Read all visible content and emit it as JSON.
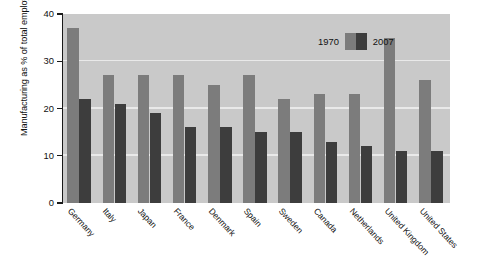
{
  "chart_data": {
    "type": "bar",
    "title": "",
    "xlabel": "",
    "ylabel": "Manufacturing as % of total employment",
    "ylim": [
      0,
      40
    ],
    "yticks": [
      0,
      10,
      20,
      30,
      40
    ],
    "ytick_labels": [
      "0",
      "10",
      "20",
      "30",
      "40"
    ],
    "grid": "horizontal",
    "legend_position": "top-right-inside",
    "categories": [
      "Germany",
      "Italy",
      "Japan",
      "France",
      "Denmark",
      "Spain",
      "Sweden",
      "Canada",
      "Netherlands",
      "United Kingdom",
      "United States"
    ],
    "series": [
      {
        "name": "1970",
        "color": "#7c7c7c",
        "values": [
          37,
          27,
          27,
          27,
          25,
          27,
          22,
          23,
          23,
          35,
          26
        ]
      },
      {
        "name": "2007",
        "color": "#3d3d3d",
        "values": [
          22,
          21,
          19,
          16,
          16,
          15,
          15,
          13,
          12,
          11,
          11
        ]
      }
    ]
  },
  "legend": {
    "items": [
      {
        "label": "1970",
        "color": "#7c7c7c"
      },
      {
        "label": "2007",
        "color": "#3d3d3d"
      }
    ]
  },
  "colors": {
    "plot_background": "#c9c9c9",
    "figure_background": "#ffffff",
    "gridline": "#eeeeee",
    "axis": "#1a1a1a",
    "series_1970": "#7c7c7c",
    "series_2007": "#3d3d3d"
  }
}
